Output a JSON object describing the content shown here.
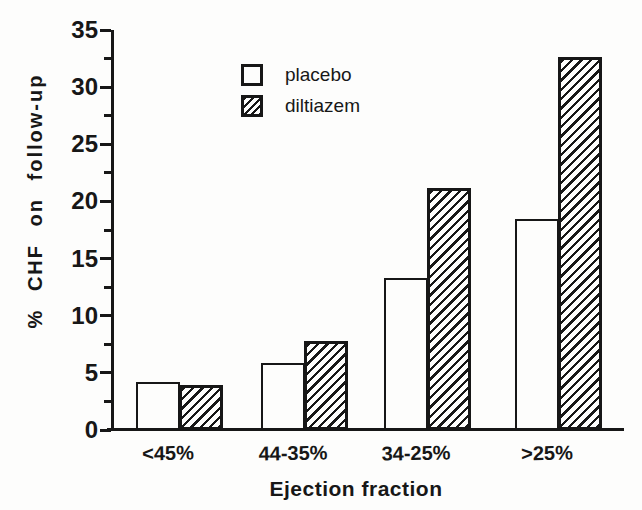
{
  "figure": {
    "background": "#fdfdfc",
    "ink": "#171717"
  },
  "chart_data": {
    "type": "bar",
    "title": "",
    "xlabel": "Ejection fraction",
    "ylabel": "% CHF on follow-up",
    "categories": [
      "<45%",
      "44-35%",
      "34-25%",
      ">25%"
    ],
    "series": [
      {
        "name": "placebo",
        "style": "open",
        "values": [
          4.2,
          5.9,
          13.3,
          18.5
        ]
      },
      {
        "name": "diltiazem",
        "style": "hatched",
        "values": [
          3.9,
          7.8,
          21.2,
          32.6
        ]
      }
    ],
    "ylim": [
      0,
      35
    ],
    "ytick_step": 5,
    "yminor_step": 2.5,
    "ytick_labels": [
      "0",
      "5",
      "10",
      "15",
      "20",
      "25",
      "30",
      "35"
    ],
    "grid": false,
    "legend_position": "upper-left-inside",
    "legend_swatches": [
      "open-square-icon",
      "hatched-square-icon"
    ]
  }
}
